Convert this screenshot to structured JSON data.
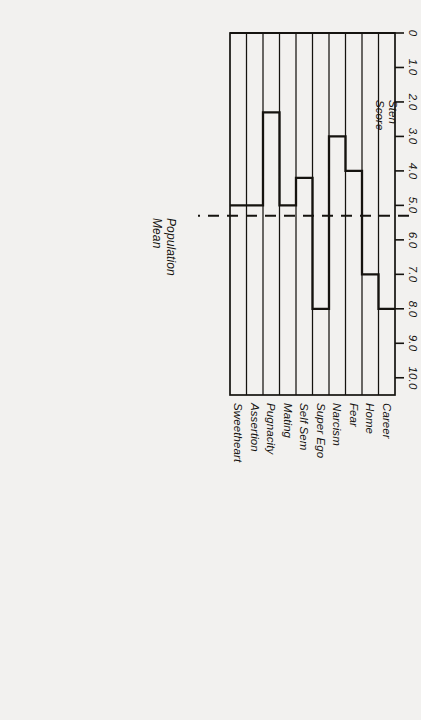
{
  "chart_data": {
    "type": "line",
    "title": "",
    "orientation": "rotated-180-horizontal-profile",
    "ylabel": "Sten\nScore",
    "ylabel_line1": "Sten",
    "ylabel_line2": "Score",
    "xlabel": "",
    "ylim": [
      0,
      10.5
    ],
    "yticks": [
      0,
      1,
      2,
      3,
      4,
      5,
      6,
      7,
      8,
      9,
      10
    ],
    "ytick_labels": [
      "0",
      "1.0",
      "2.0",
      "3.0",
      "4.0",
      "5.0",
      "6.0",
      "7.0",
      "8.0",
      "9.0",
      "10.0"
    ],
    "grid": "category-separators-only",
    "legend": "none",
    "categories": [
      "Career",
      "Home",
      "Fear",
      "Narcism",
      "Super Ego",
      "Self Sem",
      "Mating",
      "Pugnacity",
      "Assertion",
      "Sweetheart"
    ],
    "values": [
      8.0,
      7.0,
      4.0,
      3.0,
      8.0,
      4.2,
      5.0,
      2.3,
      5.0,
      5.0
    ],
    "series": [
      {
        "name": "Profile",
        "values": [
          8.0,
          7.0,
          4.0,
          3.0,
          8.0,
          4.2,
          5.0,
          2.3,
          5.0,
          5.0
        ]
      }
    ],
    "annotations": [
      {
        "name": "population-mean",
        "label": "Population\nMean",
        "label_line1": "Population",
        "label_line2": "Mean",
        "value": 5.3,
        "style": "dashed-reference-line"
      }
    ],
    "colors": {
      "line": "#15130f",
      "axis": "#15130f",
      "background": "#f2f1ef"
    }
  }
}
